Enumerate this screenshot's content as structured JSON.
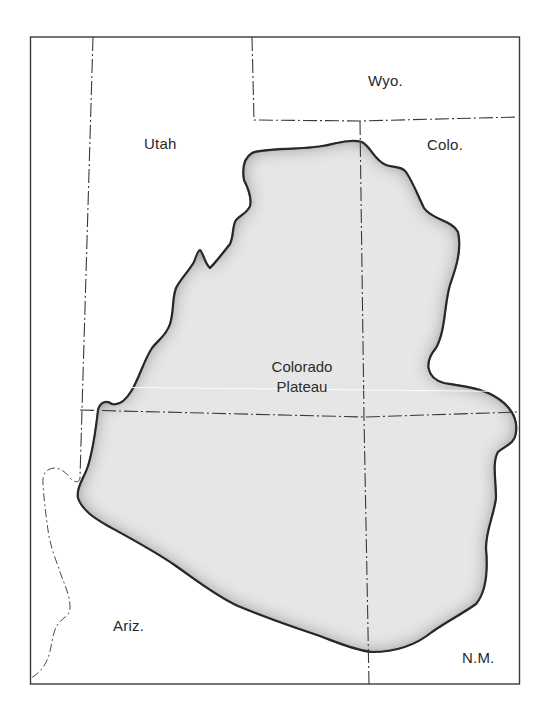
{
  "map": {
    "title": "Colorado Plateau",
    "feature": {
      "label_line1": "Colorado",
      "label_line2": "Plateau",
      "fill_center": "#ececec",
      "fill_edge": "#7a7a7a",
      "outline": "#1e1e1e"
    },
    "states": [
      {
        "id": "utah",
        "label": "Utah"
      },
      {
        "id": "wyoming",
        "label": "Wyo."
      },
      {
        "id": "colorado",
        "label": "Colo."
      },
      {
        "id": "arizona",
        "label": "Ariz."
      },
      {
        "id": "new-mexico",
        "label": "N.M."
      }
    ],
    "colors": {
      "background": "#ffffff",
      "border_line": "#3a3a3a",
      "text": "#2a2a2a"
    }
  }
}
